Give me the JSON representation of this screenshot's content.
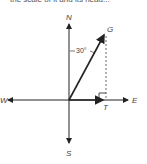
{
  "caption_fragment": "the scale of it and its head...",
  "diagram": {
    "labels": {
      "north": "N",
      "south": "S",
      "east": "E",
      "west": "W",
      "g": "G",
      "t": "T",
      "angle": "30°"
    }
  }
}
